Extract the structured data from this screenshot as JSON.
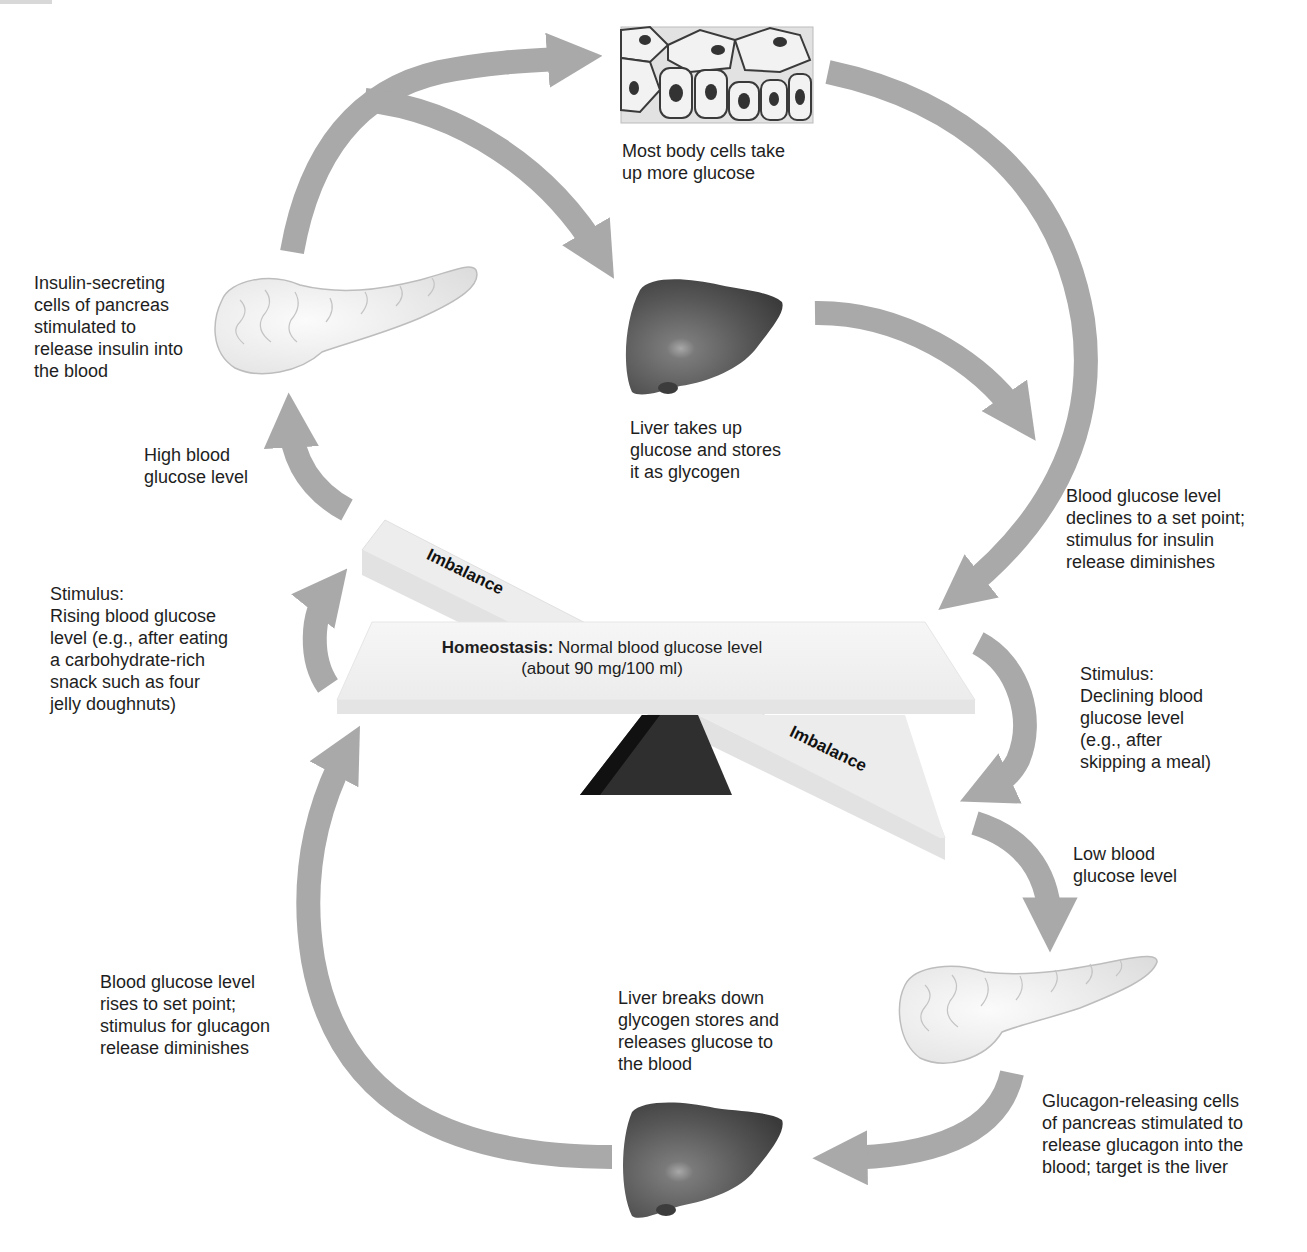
{
  "diagram": {
    "colors": {
      "arrow": "#a9a9a9",
      "text": "#1e1e1e",
      "liver": "#5a5a5a",
      "pancreas": "#ececec",
      "seesaw_beam": "#f0f0f0",
      "fulcrum": "#2b2b2b"
    },
    "center": {
      "homeostasis_label": "Homeostasis:",
      "homeostasis_text": "Normal blood glucose level",
      "homeostasis_value": "(about 90 mg/100 ml)",
      "imbalance_top": "Imbalance",
      "imbalance_bottom": "Imbalance"
    },
    "top_loop": {
      "body_cells": "Most body cells take\nup more glucose",
      "pancreas_insulin": "Insulin-secreting\ncells of pancreas\nstimulated to\nrelease insulin into\nthe blood",
      "liver_stores": "Liver takes up\nglucose and stores\nit as glycogen",
      "high_glucose": "High blood\nglucose level",
      "stimulus_rising": "Stimulus:\nRising blood glucose\nlevel (e.g., after eating\na carbohydrate-rich\nsnack such as four\njelly doughnuts)",
      "declines_set_point": "Blood glucose level\ndeclines to a set point;\nstimulus for insulin\nrelease diminishes"
    },
    "bottom_loop": {
      "stimulus_declining": "Stimulus:\nDeclining blood\nglucose level\n(e.g., after\nskipping a meal)",
      "low_glucose": "Low blood\nglucose level",
      "pancreas_glucagon": "Glucagon-releasing cells\nof pancreas stimulated to\nrelease glucagon into the\nblood; target is the liver",
      "liver_releases": "Liver breaks down\nglycogen stores and\nreleases glucose to\nthe blood",
      "rises_set_point": "Blood glucose level\nrises to set point;\nstimulus for glucagon\nrelease diminishes"
    },
    "icons": [
      "body-cells-illustration",
      "pancreas-illustration",
      "liver-illustration",
      "seesaw-fulcrum",
      "flow-arrow"
    ]
  }
}
